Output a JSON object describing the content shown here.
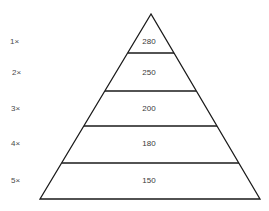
{
  "diagram": {
    "type": "pyramid",
    "colors": {
      "stroke": "#1a1a1a",
      "text": "#3a3a3a",
      "label": "#4a4a4a",
      "background": "#ffffff"
    },
    "tiers": [
      {
        "multiplier": "1×",
        "value": "280"
      },
      {
        "multiplier": "2×",
        "value": "250"
      },
      {
        "multiplier": "3×",
        "value": "200"
      },
      {
        "multiplier": "4×",
        "value": "180"
      },
      {
        "multiplier": "5×",
        "value": "150"
      }
    ]
  }
}
